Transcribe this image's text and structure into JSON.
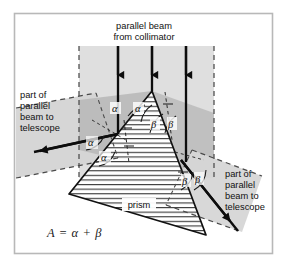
{
  "figure": {
    "frame_color": "#b8b8b8",
    "background": "#ffffff",
    "plane_fill_light": "#dcdcdc",
    "plane_fill_dark": "#b9b9b9",
    "line_color": "#111111",
    "hatch_color": "#303030"
  },
  "labels": {
    "top_beam_line1": "parallel beam",
    "top_beam_line2": "from collimator",
    "left_beam_line1": "part of",
    "left_beam_line2": "parallel",
    "left_beam_line3": "beam to",
    "left_beam_line4": "telescope",
    "right_beam_line1": "part of",
    "right_beam_line2": "parallel",
    "right_beam_line3": "beam to",
    "right_beam_line4": "telescope",
    "prism": "prism",
    "formula": "A  =  α  +  β"
  },
  "angles": {
    "alpha": "α",
    "beta": "β",
    "alpha_marks": [
      {
        "id": "alpha-apex-left",
        "x": 115,
        "y": 110
      },
      {
        "id": "alpha-apex-right",
        "x": 138,
        "y": 110
      },
      {
        "id": "alpha-left-upper",
        "x": 92,
        "y": 143
      },
      {
        "id": "alpha-left-lower",
        "x": 104,
        "y": 157
      }
    ],
    "beta_marks": [
      {
        "id": "beta-apex-left",
        "x": 155,
        "y": 124
      },
      {
        "id": "beta-apex-right",
        "x": 172,
        "y": 124
      },
      {
        "id": "beta-exit-left",
        "x": 186,
        "y": 183
      },
      {
        "id": "beta-exit-right",
        "x": 199,
        "y": 181
      }
    ]
  },
  "geometry": {
    "apex": {
      "x": 152,
      "y": 91
    },
    "entry_point": {
      "x": 87,
      "y": 135
    },
    "exit_point": {
      "x": 181,
      "y": 160
    },
    "prism_base_left": {
      "x": 69,
      "y": 194
    },
    "prism_base_right": {
      "x": 206,
      "y": 235
    },
    "incident_beams_x": [
      118,
      152,
      186
    ],
    "incident_top_y": 46
  }
}
